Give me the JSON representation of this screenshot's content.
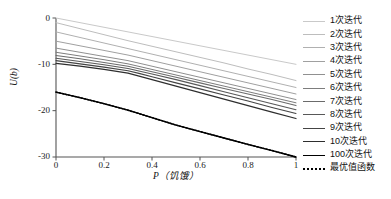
{
  "chart_data": {
    "type": "line",
    "title": "",
    "xlabel": "P（饥饿）",
    "ylabel": "U(b)",
    "xlim": [
      0,
      1
    ],
    "ylim": [
      -30,
      0
    ],
    "grid": false,
    "legend_position": "right",
    "x_ticks": [
      "0",
      "0.2",
      "0.4",
      "0.6",
      "0.8",
      "1"
    ],
    "x_tick_values": [
      0,
      0.2,
      0.4,
      0.6,
      0.8,
      1
    ],
    "y_ticks": [
      "0",
      "-10",
      "-20",
      "-30"
    ],
    "y_tick_values": [
      0,
      -10,
      -20,
      -30
    ],
    "x": [
      0,
      0.1,
      0.2,
      0.3,
      0.35,
      0.4,
      0.5,
      0.6,
      0.7,
      0.8,
      0.9,
      1
    ],
    "series": [
      {
        "name": "1次迭代",
        "color": "#c9c9c9",
        "width": 1.0,
        "dashed": false,
        "values": [
          0,
          -1.0,
          -2.0,
          -3.0,
          -3.5,
          -4.0,
          -5.0,
          -6.0,
          -7.0,
          -8.0,
          -9.0,
          -10.0
        ]
      },
      {
        "name": "2次迭代",
        "color": "#bdbdbd",
        "width": 1.0,
        "dashed": false,
        "values": [
          -1.0,
          -2.3,
          -3.6,
          -4.9,
          -5.5,
          -6.1,
          -7.3,
          -8.5,
          -9.7,
          -11.0,
          -12.2,
          -13.5
        ]
      },
      {
        "name": "3次迭代",
        "color": "#b0b0b0",
        "width": 1.0,
        "dashed": false,
        "values": [
          -3.0,
          -4.2,
          -5.4,
          -6.6,
          -7.2,
          -7.8,
          -9.0,
          -10.2,
          -11.4,
          -12.6,
          -13.8,
          -15.0
        ]
      },
      {
        "name": "4次迭代",
        "color": "#a0a0a0",
        "width": 1.0,
        "dashed": false,
        "values": [
          -5.0,
          -6.0,
          -7.0,
          -8.0,
          -8.6,
          -9.2,
          -10.4,
          -11.6,
          -12.8,
          -14.0,
          -15.2,
          -16.4
        ]
      },
      {
        "name": "5次迭代",
        "color": "#909090",
        "width": 1.0,
        "dashed": false,
        "values": [
          -6.5,
          -7.4,
          -8.3,
          -9.2,
          -9.8,
          -10.4,
          -11.6,
          -12.8,
          -14.0,
          -15.2,
          -16.4,
          -17.6
        ]
      },
      {
        "name": "6次迭代",
        "color": "#7d7d7d",
        "width": 1.0,
        "dashed": false,
        "values": [
          -7.4,
          -8.2,
          -9.0,
          -9.9,
          -10.5,
          -11.1,
          -12.3,
          -13.5,
          -14.7,
          -15.9,
          -17.1,
          -18.3
        ]
      },
      {
        "name": "7次迭代",
        "color": "#6b6b6b",
        "width": 1.1,
        "dashed": false,
        "values": [
          -8.1,
          -8.8,
          -9.6,
          -10.4,
          -11.0,
          -11.6,
          -12.8,
          -14.0,
          -15.2,
          -16.4,
          -17.6,
          -18.9
        ]
      },
      {
        "name": "8次迭代",
        "color": "#585858",
        "width": 1.1,
        "dashed": false,
        "values": [
          -8.7,
          -9.4,
          -10.1,
          -10.9,
          -11.5,
          -12.1,
          -13.3,
          -14.6,
          -15.9,
          -17.2,
          -18.5,
          -19.8
        ]
      },
      {
        "name": "9次迭代",
        "color": "#444444",
        "width": 1.1,
        "dashed": false,
        "values": [
          -9.2,
          -9.9,
          -10.6,
          -11.4,
          -12.0,
          -12.7,
          -14.0,
          -15.3,
          -16.6,
          -17.9,
          -19.3,
          -20.6
        ]
      },
      {
        "name": "10次迭代",
        "color": "#2e2e2e",
        "width": 1.2,
        "dashed": false,
        "values": [
          -9.8,
          -10.4,
          -11.1,
          -11.9,
          -12.6,
          -13.3,
          -14.7,
          -16.1,
          -17.5,
          -18.9,
          -20.3,
          -21.7
        ]
      },
      {
        "name": "100次迭代",
        "color": "#000000",
        "width": 1.3,
        "dashed": false,
        "values": [
          -16.0,
          -17.2,
          -18.5,
          -19.9,
          -20.7,
          -21.5,
          -23.1,
          -24.5,
          -25.9,
          -27.3,
          -28.6,
          -30.0
        ]
      },
      {
        "name": "最优值函数",
        "color": "#000000",
        "width": 1.5,
        "dashed": true,
        "values": [
          -16.0,
          -17.2,
          -18.5,
          -19.9,
          -20.7,
          -21.5,
          -23.1,
          -24.5,
          -25.9,
          -27.3,
          -28.6,
          -30.0
        ]
      }
    ]
  },
  "axes": {
    "spine_color": "#555555",
    "tick_color": "#555555"
  }
}
